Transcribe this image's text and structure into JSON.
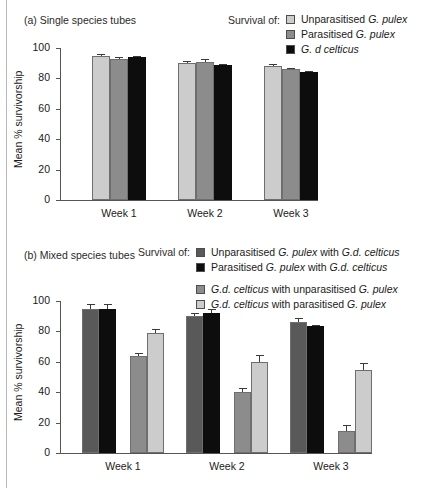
{
  "figure": {
    "panel_a": {
      "title": "(a) Single species tubes",
      "survival_label": "Survival of:",
      "ylabel": "Mean % survivorship"
    },
    "panel_b": {
      "title": "(b) Mixed species tubes",
      "survival_label": "Survival of:",
      "ylabel": "Mean % survivorship"
    }
  },
  "colors": {
    "light_gray": "#cccccc",
    "medium_gray": "#8c8c8c",
    "dark_gray": "#595959",
    "black": "#0d0d0d",
    "axis": "#555555"
  },
  "legend_a": [
    {
      "label_html": "Unparasitised <i>G. pulex</i>",
      "label": "Unparasitised G. pulex",
      "color": "#cccccc"
    },
    {
      "label_html": "Parasitised <i>G. pulex</i>",
      "label": "Parasitised G. pulex",
      "color": "#8c8c8c"
    },
    {
      "label_html": "<i>G. d celticus</i>",
      "label": "G. d celticus",
      "color": "#0d0d0d"
    }
  ],
  "legend_b": [
    {
      "label_html": "Unparasitised <i>G. pulex</i> with <i>G.d. celticus</i>",
      "label": "Unparasitised G. pulex with G.d. celticus",
      "color": "#595959",
      "gap": false
    },
    {
      "label_html": "Parasitised <i>G. pulex</i> with <i>G.d. celticus</i>",
      "label": "Parasitised G. pulex with G.d. celticus",
      "color": "#0d0d0d",
      "gap": false
    },
    {
      "label_html": "<i>G.d. celticus</i> with unparasitised <i>G. pulex</i>",
      "label": "G.d. celticus with unparasitised G. pulex",
      "color": "#8c8c8c",
      "gap": true
    },
    {
      "label_html": "<i>G.d. celticus</i> with parasitised <i>G. pulex</i>",
      "label": "G.d. celticus with parasitised G. pulex",
      "color": "#cccccc",
      "gap": false
    }
  ],
  "chart_data": [
    {
      "type": "bar",
      "panel": "a",
      "title": "(a) Single species tubes",
      "xlabel": "",
      "ylabel": "Mean % survivorship",
      "ylim": [
        0,
        100
      ],
      "yticks": [
        0,
        20,
        40,
        60,
        80,
        100
      ],
      "grid": false,
      "legend_position": "top-right",
      "categories": [
        "Week 1",
        "Week 2",
        "Week 3"
      ],
      "series": [
        {
          "name": "Unparasitised G. pulex",
          "color": "#cccccc",
          "values": [
            95,
            90,
            88
          ],
          "errors": [
            1.2,
            1.2,
            1.2
          ]
        },
        {
          "name": "Parasitised G. pulex",
          "color": "#8c8c8c",
          "values": [
            93,
            91,
            86
          ],
          "errors": [
            1.0,
            1.5,
            0.9
          ]
        },
        {
          "name": "G. d celticus",
          "color": "#0d0d0d",
          "values": [
            94,
            89,
            84
          ],
          "errors": [
            0.8,
            0.8,
            0.6
          ]
        }
      ]
    },
    {
      "type": "bar",
      "panel": "b",
      "title": "(b) Mixed species tubes",
      "xlabel": "",
      "ylabel": "Mean % survivorship",
      "ylim": [
        0,
        100
      ],
      "yticks": [
        0,
        20,
        40,
        60,
        80,
        100
      ],
      "grid": false,
      "legend_position": "top-right",
      "categories": [
        "Week 1",
        "Week 2",
        "Week 3"
      ],
      "series": [
        {
          "name": "Unparasitised G. pulex with G.d. celticus",
          "color": "#595959",
          "values": [
            95,
            90,
            86
          ],
          "errors": [
            3.0,
            2.0,
            2.5
          ]
        },
        {
          "name": "Parasitised G. pulex with G.d. celticus",
          "color": "#0d0d0d",
          "values": [
            95,
            92,
            83.5
          ],
          "errors": [
            3.0,
            3.0,
            1.0
          ]
        },
        {
          "name": "G.d. celticus with unparasitised G. pulex",
          "color": "#8c8c8c",
          "values": [
            64,
            40,
            14.5
          ],
          "errors": [
            2.0,
            3.0,
            4.0
          ]
        },
        {
          "name": "G.d. celticus with parasitised G. pulex",
          "color": "#cccccc",
          "values": [
            79,
            60,
            54.5
          ],
          "errors": [
            2.5,
            4.5,
            4.5
          ]
        }
      ]
    }
  ]
}
